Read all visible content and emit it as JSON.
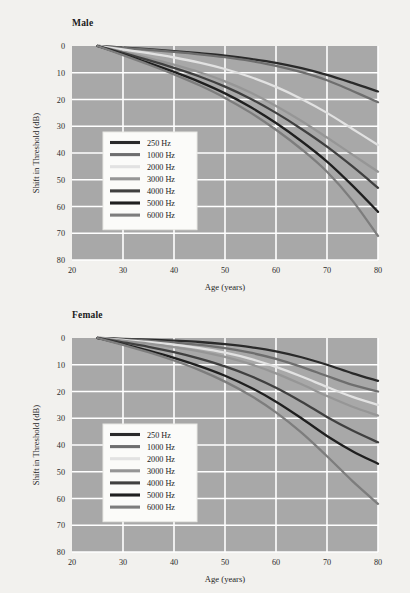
{
  "page": {
    "background_color": "#f2f1ee"
  },
  "chart_data": [
    {
      "type": "line",
      "title": "Male",
      "xlabel": "Age (years)",
      "ylabel": "Shift in Threshold (dB)",
      "xlim": [
        20,
        80
      ],
      "ylim": [
        80,
        0
      ],
      "y_inverted": true,
      "xticks": [
        20,
        30,
        40,
        50,
        60,
        70,
        80
      ],
      "yticks": [
        0,
        10,
        20,
        30,
        40,
        50,
        60,
        70,
        80
      ],
      "grid": true,
      "plot_background": "#a8a8a8",
      "grid_color": "#ffffff",
      "legend_position": "inside-left-center",
      "x": [
        25,
        30,
        35,
        40,
        45,
        50,
        55,
        60,
        65,
        70,
        75,
        80
      ],
      "series": [
        {
          "name": "250 Hz",
          "color": "#2a2a2a",
          "values": [
            0,
            0.6,
            1.2,
            1.9,
            2.7,
            3.6,
            4.8,
            6.3,
            8.3,
            10.8,
            13.8,
            17.0
          ]
        },
        {
          "name": "1000 Hz",
          "color": "#6e6e6e",
          "values": [
            0,
            0.7,
            1.4,
            2.2,
            3.1,
            4.2,
            5.6,
            7.4,
            9.8,
            12.8,
            16.8,
            21.0
          ]
        },
        {
          "name": "2000 Hz",
          "color": "#e2e2e2",
          "values": [
            0,
            1.3,
            2.7,
            4.3,
            6.2,
            8.6,
            11.6,
            15.3,
            19.8,
            25.0,
            31.0,
            37.0
          ]
        },
        {
          "name": "3000 Hz",
          "color": "#969696",
          "values": [
            0,
            2.2,
            4.5,
            7.0,
            9.8,
            13.2,
            17.4,
            22.4,
            28.0,
            34.2,
            40.6,
            47.0
          ]
        },
        {
          "name": "4000 Hz",
          "color": "#404040",
          "values": [
            0,
            2.6,
            5.3,
            8.2,
            11.4,
            15.2,
            19.7,
            25.0,
            31.0,
            37.6,
            45.0,
            53.0
          ]
        },
        {
          "name": "5000 Hz",
          "color": "#1f1f1f",
          "values": [
            0,
            3.1,
            6.3,
            9.7,
            13.4,
            17.7,
            22.8,
            28.8,
            35.6,
            43.2,
            52.2,
            62.0
          ]
        },
        {
          "name": "6000 Hz",
          "color": "#7d7d7d",
          "values": [
            0,
            3.4,
            6.9,
            10.6,
            14.7,
            19.4,
            24.9,
            31.3,
            38.6,
            47.0,
            57.8,
            71.0
          ]
        }
      ]
    },
    {
      "type": "line",
      "title": "Female",
      "xlabel": "Age (years)",
      "ylabel": "Shift in Threshold (dB)",
      "xlim": [
        20,
        80
      ],
      "ylim": [
        80,
        0
      ],
      "y_inverted": true,
      "xticks": [
        20,
        30,
        40,
        50,
        60,
        70,
        80
      ],
      "yticks": [
        0,
        10,
        20,
        30,
        40,
        50,
        60,
        70,
        80
      ],
      "grid": true,
      "plot_background": "#a8a8a8",
      "grid_color": "#ffffff",
      "legend_position": "inside-left-center",
      "x": [
        25,
        30,
        35,
        40,
        45,
        50,
        55,
        60,
        65,
        70,
        75,
        80
      ],
      "series": [
        {
          "name": "250 Hz",
          "color": "#2a2a2a",
          "values": [
            0,
            0.3,
            0.6,
            1.0,
            1.5,
            2.3,
            3.4,
            5.0,
            7.2,
            10.0,
            13.2,
            16.0
          ]
        },
        {
          "name": "1000 Hz",
          "color": "#6e6e6e",
          "values": [
            0,
            0.5,
            1.0,
            1.7,
            2.6,
            3.8,
            5.5,
            7.8,
            10.8,
            14.2,
            17.5,
            20.0
          ]
        },
        {
          "name": "2000 Hz",
          "color": "#e2e2e2",
          "values": [
            0,
            0.7,
            1.5,
            2.5,
            3.8,
            5.5,
            7.8,
            10.8,
            14.4,
            18.3,
            22.0,
            25.0
          ]
        },
        {
          "name": "3000 Hz",
          "color": "#969696",
          "values": [
            0,
            1.0,
            2.1,
            3.4,
            5.0,
            7.1,
            9.8,
            13.2,
            17.3,
            21.7,
            25.7,
            29.0
          ]
        },
        {
          "name": "4000 Hz",
          "color": "#404040",
          "values": [
            0,
            1.6,
            3.3,
            5.3,
            7.7,
            10.6,
            14.2,
            18.6,
            23.8,
            29.5,
            34.6,
            39.0
          ]
        },
        {
          "name": "5000 Hz",
          "color": "#1f1f1f",
          "values": [
            0,
            2.3,
            4.7,
            7.4,
            10.5,
            14.1,
            18.5,
            23.8,
            30.0,
            36.6,
            42.3,
            47.0
          ]
        },
        {
          "name": "6000 Hz",
          "color": "#7d7d7d",
          "values": [
            0,
            2.6,
            5.3,
            8.4,
            12.0,
            16.3,
            21.5,
            27.8,
            35.4,
            44.2,
            53.5,
            62.0
          ]
        }
      ]
    }
  ]
}
